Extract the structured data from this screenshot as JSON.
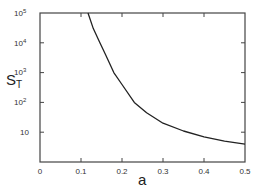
{
  "chart_data": {
    "type": "line",
    "title": "",
    "xlabel": "a",
    "ylabel": "S_T",
    "ylabel_main": "S",
    "ylabel_sub": "T",
    "yscale": "log",
    "xlim": [
      0,
      0.5
    ],
    "ylim": [
      1,
      100000
    ],
    "grid": false,
    "x_ticks": [
      "0",
      "0.1",
      "0.2",
      "0.3",
      "0.4",
      "0.5"
    ],
    "y_ticks": [
      "10",
      "10^2",
      "10^3",
      "10^4",
      "10^5"
    ],
    "series": [
      {
        "name": "S_T",
        "x": [
          0.117,
          0.13,
          0.146,
          0.16,
          0.18,
          0.2,
          0.23,
          0.26,
          0.3,
          0.35,
          0.4,
          0.45,
          0.5
        ],
        "y": [
          100000,
          30000,
          10000,
          4000,
          1000,
          400,
          100,
          45,
          20,
          11,
          7,
          5,
          4
        ]
      }
    ]
  }
}
